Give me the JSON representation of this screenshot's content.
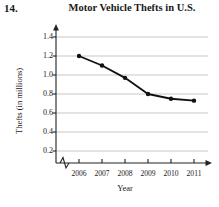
{
  "exercise": {
    "number": "14."
  },
  "chart_data": {
    "type": "line",
    "title": "Motor Vehicle Thefts in U.S.",
    "xlabel": "Year",
    "ylabel": "Thefts (in millions)",
    "categories": [
      "2006",
      "2007",
      "2008",
      "2009",
      "2010",
      "2011"
    ],
    "values": [
      1.2,
      1.1,
      0.97,
      0.8,
      0.75,
      0.73
    ],
    "x": [
      2006,
      2007,
      2008,
      2009,
      2010,
      2011
    ],
    "xlim": [
      2006,
      2011
    ],
    "ylim": [
      0,
      1.4
    ],
    "ytick_labels": [
      "0.2",
      "0.4",
      "0.6",
      "0.8",
      "1.0",
      "1.2",
      "1.4"
    ],
    "ytick_values": [
      0.2,
      0.4,
      0.6,
      0.8,
      1.0,
      1.2,
      1.4
    ],
    "xtick_labels": [
      "2006",
      "2007",
      "2008",
      "2009",
      "2010",
      "2011"
    ],
    "grid": "horizontal",
    "legend": "none",
    "axis_break_x": true,
    "axis_break_y": true,
    "marker": "filled-circle",
    "line_color": "#111111",
    "grid_color": "#b9b9b9",
    "axis_color": "#222222"
  }
}
